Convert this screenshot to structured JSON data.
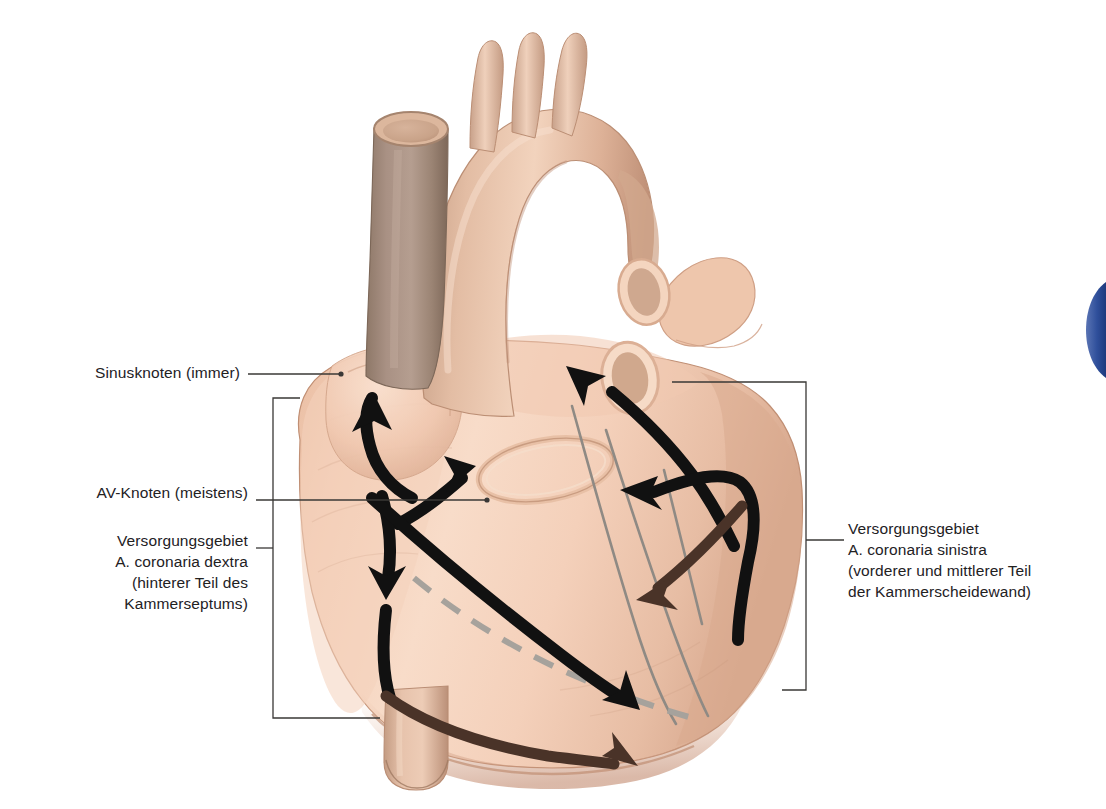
{
  "figure": {
    "kind": "anatomical-illustration",
    "language": "de",
    "background_color": "#ffffff"
  },
  "labels": {
    "sinus_node": "Sinusknoten (immer)",
    "av_node": "AV-Knoten (meistens)",
    "coronaria_dextra": "Versorgungsgebiet\nA. coronaria dextra\n(hinterer Teil des\nKammerseptums)",
    "coronaria_sinistra": "Versorgungsgebiet\nA. coronaria sinistra\n(vorderer und mittlerer Teil\nder Kammerscheidewand)"
  },
  "colors": {
    "text": "#23211f",
    "leader_line": "#3a3836",
    "myocardium_light": "#f6d3bc",
    "myocardium_mid": "#edc0a5",
    "myocardium_shadow": "#d9a88c",
    "myocardium_deep": "#c2917a",
    "vessel_gray": "#a89483",
    "vessel_gray_dark": "#8d7869",
    "vessel_highlight": "#f7e0d0",
    "arrow_black": "#111111",
    "arrow_brown": "#4a3328",
    "coronary_line": "#8f8a84",
    "dashed_line": "#a6a29c",
    "page_accent_blue": "#2f4f9b"
  },
  "anatomy": {
    "parts": [
      "Aortenbogen",
      "Truncus brachiocephalicus",
      "A. carotis communis sinistra",
      "A. subclavia sinistra",
      "Truncus pulmonalis",
      "Vena cava superior",
      "Lungenvenen",
      "Vena cava inferior",
      "rechter Ventrikel",
      "linker Ventrikel",
      "Herzohr"
    ]
  },
  "arrows": {
    "count": 7,
    "items": [
      {
        "name": "sinus-to-atrium",
        "color": "#111111",
        "direction": "aufwaerts-links"
      },
      {
        "name": "av-node-upward",
        "color": "#111111",
        "direction": "aufwaerts-rechts"
      },
      {
        "name": "av-node-downward",
        "color": "#111111",
        "direction": "abwaerts"
      },
      {
        "name": "septum-anterior",
        "color": "#111111",
        "direction": "abwaerts-rechts"
      },
      {
        "name": "left-coronary-up",
        "color": "#111111",
        "direction": "aufwaerts-links"
      },
      {
        "name": "left-coronary-hook",
        "color": "#111111",
        "direction": "links-und-abwaerts"
      },
      {
        "name": "posterior-descending",
        "color": "#4a3328",
        "direction": "rechts"
      }
    ]
  },
  "accent": {
    "name": "page-edge-marker",
    "color": "#2f4f9b"
  }
}
